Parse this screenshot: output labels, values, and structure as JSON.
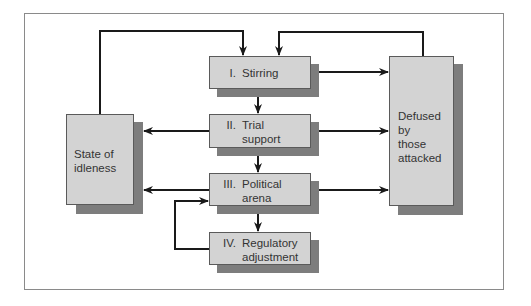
{
  "diagram": {
    "stages": [
      {
        "id": "stirring",
        "numeral": "I.",
        "label": "Stirring"
      },
      {
        "id": "trial-support",
        "numeral": "II.",
        "label": "Trial\nsupport"
      },
      {
        "id": "political-arena",
        "numeral": "III.",
        "label": "Political\narena"
      },
      {
        "id": "regulatory-adjustment",
        "numeral": "IV.",
        "label": "Regulatory\nadjustment"
      }
    ],
    "idle_state": {
      "label": "State of\nidleness"
    },
    "defused": {
      "label": "Defused\nby\nthose\nattacked"
    },
    "edges": [
      {
        "from": "State of idleness",
        "to": "I. Stirring"
      },
      {
        "from": "Defused by those attacked",
        "to": "I. Stirring"
      },
      {
        "from": "I. Stirring",
        "to": "II. Trial support"
      },
      {
        "from": "II. Trial support",
        "to": "III. Political arena"
      },
      {
        "from": "III. Political arena",
        "to": "IV. Regulatory adjustment"
      },
      {
        "from": "IV. Regulatory adjustment",
        "to": "III. Political arena"
      },
      {
        "from": "I. Stirring",
        "to": "Defused by those attacked"
      },
      {
        "from": "II. Trial support",
        "to": "Defused by those attacked"
      },
      {
        "from": "III. Political arena",
        "to": "Defused by those attacked"
      },
      {
        "from": "II. Trial support",
        "to": "State of idleness"
      },
      {
        "from": "III. Political arena",
        "to": "State of idleness"
      }
    ],
    "colors": {
      "box_fill": "#d3d3d3",
      "shadow": "#7d7d7d",
      "border": "#5a5a5a",
      "line": "#1a1a1a"
    }
  }
}
